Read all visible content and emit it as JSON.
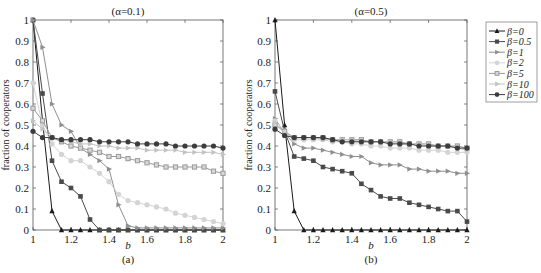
{
  "chart_data": [
    {
      "type": "line",
      "panel_label": "(a)",
      "title": "(α=0.1)",
      "xlabel": "b",
      "ylabel": "fraction of cooperators",
      "xlim": [
        1,
        2
      ],
      "ylim": [
        0,
        1
      ],
      "xticks": [
        "1",
        "1.2",
        "1.4",
        "1.6",
        "1.8",
        "2"
      ],
      "yticks": [
        "0",
        "0.1",
        "0.2",
        "0.3",
        "0.4",
        "0.5",
        "0.6",
        "0.7",
        "0.8",
        "0.9",
        "1"
      ],
      "grid": false,
      "x": [
        1,
        1.05,
        1.1,
        1.15,
        1.2,
        1.25,
        1.3,
        1.35,
        1.4,
        1.45,
        1.5,
        1.55,
        1.6,
        1.65,
        1.7,
        1.75,
        1.8,
        1.85,
        1.9,
        1.95,
        2
      ],
      "series": [
        {
          "name": "β=0",
          "values": [
            1,
            0.52,
            0.09,
            0,
            0,
            0,
            0,
            0,
            0,
            0,
            0,
            0,
            0,
            0,
            0,
            0,
            0,
            0,
            0,
            0,
            0
          ]
        },
        {
          "name": "β=0.5",
          "values": [
            1,
            0.65,
            0.33,
            0.23,
            0.2,
            0.16,
            0.05,
            0,
            0,
            0,
            0,
            0,
            0,
            0,
            0,
            0,
            0,
            0,
            0,
            0,
            0
          ]
        },
        {
          "name": "β=1",
          "values": [
            1,
            0.87,
            0.6,
            0.5,
            0.47,
            0.39,
            0.36,
            0.33,
            0.29,
            0.12,
            0.02,
            0.01,
            0.01,
            0.01,
            0.01,
            0.01,
            0.01,
            0.01,
            0.01,
            0.01,
            0.01
          ]
        },
        {
          "name": "β=2",
          "values": [
            0.7,
            0.5,
            0.41,
            0.36,
            0.33,
            0.33,
            0.3,
            0.27,
            0.23,
            0.17,
            0.14,
            0.13,
            0.12,
            0.11,
            0.1,
            0.08,
            0.07,
            0.06,
            0.05,
            0.04,
            0.03
          ]
        },
        {
          "name": "β=5",
          "values": [
            0.58,
            0.52,
            0.44,
            0.42,
            0.4,
            0.39,
            0.38,
            0.37,
            0.35,
            0.35,
            0.34,
            0.33,
            0.32,
            0.31,
            0.3,
            0.3,
            0.3,
            0.3,
            0.3,
            0.28,
            0.27
          ]
        },
        {
          "name": "β=10",
          "values": [
            0.52,
            0.48,
            0.44,
            0.43,
            0.42,
            0.41,
            0.41,
            0.4,
            0.4,
            0.39,
            0.39,
            0.39,
            0.38,
            0.38,
            0.38,
            0.38,
            0.37,
            0.37,
            0.37,
            0.37,
            0.36
          ]
        },
        {
          "name": "β=100",
          "values": [
            0.47,
            0.44,
            0.44,
            0.43,
            0.43,
            0.43,
            0.43,
            0.42,
            0.42,
            0.42,
            0.42,
            0.41,
            0.41,
            0.41,
            0.41,
            0.4,
            0.4,
            0.4,
            0.4,
            0.4,
            0.39
          ]
        }
      ]
    },
    {
      "type": "line",
      "panel_label": "(b)",
      "title": "(α=0.5)",
      "xlabel": "b",
      "ylabel": "fraction of cooperators",
      "xlim": [
        1,
        2
      ],
      "ylim": [
        0,
        1
      ],
      "xticks": [
        "1",
        "1.2",
        "1.4",
        "1.6",
        "1.8",
        "2"
      ],
      "yticks": [
        "0",
        "0.1",
        "0.2",
        "0.3",
        "0.4",
        "0.5",
        "0.6",
        "0.7",
        "0.8",
        "0.9",
        "1"
      ],
      "grid": false,
      "x": [
        1,
        1.05,
        1.1,
        1.15,
        1.2,
        1.25,
        1.3,
        1.35,
        1.4,
        1.45,
        1.5,
        1.55,
        1.6,
        1.65,
        1.7,
        1.75,
        1.8,
        1.85,
        1.9,
        1.95,
        2
      ],
      "series": [
        {
          "name": "β=0",
          "values": [
            1,
            0.5,
            0.09,
            0,
            0,
            0,
            0,
            0,
            0,
            0,
            0,
            0,
            0,
            0,
            0,
            0,
            0,
            0,
            0,
            0,
            0
          ]
        },
        {
          "name": "β=0.5",
          "values": [
            0.66,
            0.47,
            0.35,
            0.34,
            0.33,
            0.3,
            0.29,
            0.28,
            0.27,
            0.22,
            0.19,
            0.16,
            0.15,
            0.15,
            0.13,
            0.12,
            0.11,
            0.1,
            0.09,
            0.09,
            0.04
          ]
        },
        {
          "name": "β=1",
          "values": [
            0.53,
            0.46,
            0.41,
            0.39,
            0.39,
            0.38,
            0.37,
            0.36,
            0.35,
            0.35,
            0.32,
            0.31,
            0.31,
            0.31,
            0.29,
            0.29,
            0.28,
            0.28,
            0.28,
            0.27,
            0.27
          ]
        },
        {
          "name": "β=2",
          "values": [
            0.52,
            0.47,
            0.43,
            0.43,
            0.43,
            0.43,
            0.42,
            0.42,
            0.41,
            0.41,
            0.4,
            0.4,
            0.39,
            0.39,
            0.39,
            0.38,
            0.38,
            0.38,
            0.37,
            0.37,
            0.37
          ]
        },
        {
          "name": "β=5",
          "values": [
            0.5,
            0.47,
            0.44,
            0.44,
            0.44,
            0.44,
            0.43,
            0.43,
            0.43,
            0.43,
            0.42,
            0.42,
            0.42,
            0.42,
            0.41,
            0.41,
            0.41,
            0.4,
            0.4,
            0.4,
            0.39
          ]
        },
        {
          "name": "β=10",
          "values": [
            0.51,
            0.46,
            0.44,
            0.44,
            0.44,
            0.43,
            0.43,
            0.43,
            0.43,
            0.42,
            0.42,
            0.42,
            0.42,
            0.41,
            0.41,
            0.41,
            0.4,
            0.4,
            0.4,
            0.39,
            0.38
          ]
        },
        {
          "name": "β=100",
          "values": [
            0.48,
            0.45,
            0.44,
            0.44,
            0.44,
            0.44,
            0.43,
            0.42,
            0.42,
            0.42,
            0.42,
            0.42,
            0.41,
            0.41,
            0.41,
            0.4,
            0.4,
            0.4,
            0.4,
            0.39,
            0.39
          ]
        }
      ]
    }
  ],
  "legend": {
    "position": "right",
    "entries": [
      {
        "label": "β=0",
        "marker": "triangle",
        "color": "#1a1a1a"
      },
      {
        "label": "β=0.5",
        "marker": "square",
        "color": "#4a4a4a"
      },
      {
        "label": "β=1",
        "marker": "triangle-right",
        "color": "#8f8f8f"
      },
      {
        "label": "β=2",
        "marker": "star",
        "color": "#d4d4d4"
      },
      {
        "label": "β=5",
        "marker": "square-open",
        "color": "#9a9a9a"
      },
      {
        "label": "β=10",
        "marker": "triangle-right",
        "color": "#c2c2c2"
      },
      {
        "label": "β=100",
        "marker": "circle",
        "color": "#3c3c3c"
      }
    ]
  }
}
